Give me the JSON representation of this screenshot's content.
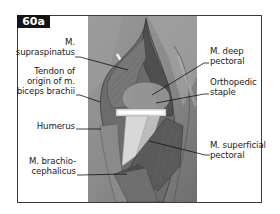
{
  "figure": {
    "id_label": "60a",
    "labels_left": [
      {
        "id": "supraspinatus",
        "lines": [
          "M.",
          "supraspinatus"
        ]
      },
      {
        "id": "biceps-tendon",
        "lines": [
          "Tendon of",
          "origin of m.",
          "biceps brachii"
        ]
      },
      {
        "id": "humerus",
        "lines": [
          "Humerus"
        ]
      },
      {
        "id": "brachiocephalicus",
        "lines": [
          "M. brachio-",
          "cephalicus"
        ]
      }
    ],
    "labels_right": [
      {
        "id": "deep-pectoral",
        "lines": [
          "M. deep",
          "pectoral"
        ]
      },
      {
        "id": "orthopedic-staple",
        "lines": [
          "Orthopedic",
          "staple"
        ]
      },
      {
        "id": "superficial-pectoral",
        "lines": [
          "M. superficial",
          "pectoral"
        ]
      }
    ]
  },
  "colors": {
    "badge_bg": "#141414",
    "frame_border": "#3a3a3a",
    "leader_line": "#111111",
    "illustration_bg": "#8f8f8f"
  }
}
